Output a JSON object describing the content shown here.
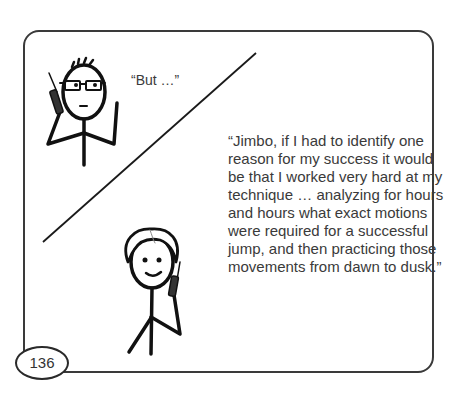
{
  "comic": {
    "page_number": "136",
    "panel_a": {
      "character": "man-with-glasses-on-phone",
      "speech": "“But …”"
    },
    "panel_b": {
      "character": "smiling-man-on-phone",
      "speech_lines": [
        "“Jimbo, if I had to identify one",
        "reason for my success it would",
        "be that I worked very hard at my",
        "technique … analyzing for hours",
        "and hours what exact motions",
        "were required for a successful",
        "jump, and then practicing those",
        "movements from dawn to dusk.”"
      ]
    },
    "colors": {
      "ink": "#1a1a1a",
      "text": "#3a3a3a",
      "background": "#ffffff"
    }
  }
}
